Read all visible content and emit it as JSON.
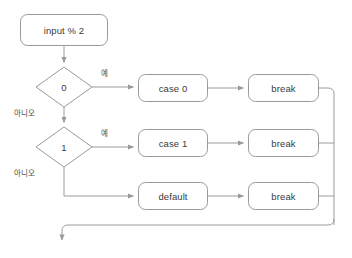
{
  "diagram": {
    "type": "flowchart",
    "background_color": "#ffffff",
    "stroke_color": "#9a9a9a",
    "text_color": "#3a3a3a",
    "nodes": {
      "start": {
        "label": "input % 2",
        "shape": "rounded-rect"
      },
      "decision0": {
        "label": "0",
        "shape": "diamond"
      },
      "decision1": {
        "label": "1",
        "shape": "diamond"
      },
      "case0": {
        "label": "case 0",
        "shape": "rounded-rect"
      },
      "case1": {
        "label": "case 1",
        "shape": "rounded-rect"
      },
      "default": {
        "label": "default",
        "shape": "rounded-rect"
      },
      "break0": {
        "label": "break",
        "shape": "rounded-rect"
      },
      "break1": {
        "label": "break",
        "shape": "rounded-rect"
      },
      "break2": {
        "label": "break",
        "shape": "rounded-rect"
      }
    },
    "edge_labels": {
      "yes0": "예",
      "no0": "아니오",
      "yes1": "예",
      "no1": "아니오"
    }
  }
}
